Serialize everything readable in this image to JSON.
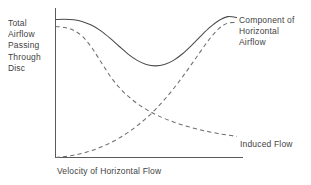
{
  "chart_data": {
    "type": "line",
    "title": "",
    "subtitle": "",
    "xlabel": "Velocity of Horizontal Flow",
    "ylabel": "Total Airflow Passing Through Disc",
    "grid": false,
    "legend_position": "inline-right",
    "axis": {
      "x_axis_line": true,
      "y_axis_line": true,
      "x_tick_labels": [],
      "y_tick_labels": [],
      "xlim": [
        0,
        1
      ],
      "ylim": [
        0,
        1
      ]
    },
    "series": [
      {
        "name": "Total Airflow Passing Through Disc",
        "style": "solid",
        "color": "#4a4a4a",
        "label_inline": "",
        "x": [
          0.0,
          0.05,
          0.1,
          0.15,
          0.2,
          0.25,
          0.3,
          0.35,
          0.4,
          0.45,
          0.5,
          0.55,
          0.6,
          0.65,
          0.7,
          0.75,
          0.8,
          0.85,
          0.9,
          0.95,
          1.0
        ],
        "y": [
          0.955,
          0.957,
          0.953,
          0.94,
          0.915,
          0.876,
          0.826,
          0.77,
          0.716,
          0.672,
          0.644,
          0.634,
          0.643,
          0.672,
          0.718,
          0.776,
          0.84,
          0.9,
          0.948,
          0.975,
          0.968
        ]
      },
      {
        "name": "Component of Horizontal Airflow",
        "style": "dashed",
        "color": "#6e6e6e",
        "label_inline": "Component of\nHorizontal\nAirflow",
        "x": [
          0.0,
          0.05,
          0.1,
          0.15,
          0.2,
          0.25,
          0.3,
          0.35,
          0.4,
          0.45,
          0.5,
          0.55,
          0.6,
          0.65,
          0.7,
          0.75,
          0.8,
          0.85,
          0.9,
          0.95,
          1.0
        ],
        "y": [
          0.0,
          0.006,
          0.016,
          0.03,
          0.048,
          0.072,
          0.1,
          0.134,
          0.174,
          0.22,
          0.272,
          0.332,
          0.4,
          0.476,
          0.558,
          0.646,
          0.736,
          0.822,
          0.892,
          0.93,
          0.934
        ]
      },
      {
        "name": "Induced Flow",
        "style": "dashed",
        "color": "#6e6e6e",
        "label_inline": "Induced Flow",
        "x": [
          0.0,
          0.05,
          0.1,
          0.15,
          0.2,
          0.25,
          0.3,
          0.35,
          0.4,
          0.45,
          0.5,
          0.55,
          0.6,
          0.65,
          0.7,
          0.75,
          0.8,
          0.85,
          0.9,
          0.95,
          1.0
        ],
        "y": [
          0.906,
          0.9,
          0.88,
          0.836,
          0.76,
          0.662,
          0.566,
          0.486,
          0.424,
          0.374,
          0.333,
          0.299,
          0.27,
          0.246,
          0.225,
          0.207,
          0.191,
          0.177,
          0.165,
          0.155,
          0.146
        ]
      }
    ],
    "annotations": [
      {
        "name": "component-of-horizontal-airflow-label",
        "text": "Component of\nHorizontal\nAirflow"
      },
      {
        "name": "induced-flow-label",
        "text": "Induced Flow"
      }
    ]
  },
  "colors": {
    "background": "#ffffff",
    "axis": "#5a5a5a",
    "solid_curve": "#4a4a4a",
    "dashed_curve": "#6e6e6e",
    "text": "#3f3f3f"
  }
}
